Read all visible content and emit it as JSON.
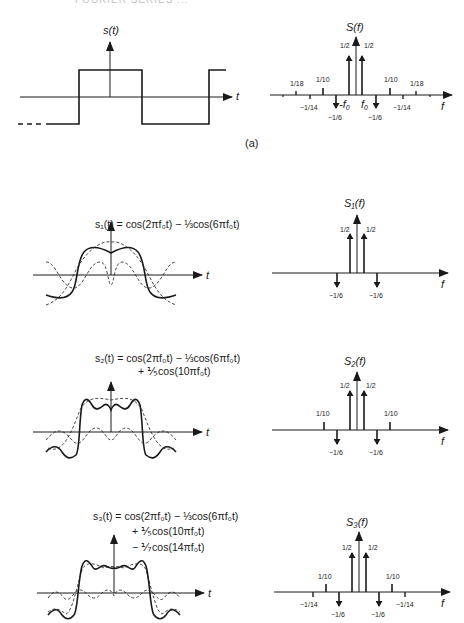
{
  "header": {
    "clipped_text": "FOURIER SERIES ..."
  },
  "panel_a": {
    "caption": "(a)",
    "time_plot": {
      "ylabel": "s(t)",
      "xlabel": "t",
      "description": "square wave"
    },
    "spectrum": {
      "ylabel": "S(f)",
      "xlabel": "f",
      "labels": {
        "f0_neg": "-f",
        "f0_pos": "f",
        "f0_sub": "0",
        "half": "1/2",
        "tenth": "1/10",
        "eighteenth": "1/18",
        "neg_sixth": "−1/6",
        "neg_fourteenth": "−1/14"
      }
    }
  },
  "panel_1": {
    "equation_line1": "s₁(t) = cos(2πf₀t) − ⅓cos(6πf₀t)",
    "time_xlabel": "t",
    "spectrum_ylabel": "S₁(f)",
    "spectrum_xlabel": "f"
  },
  "panel_2": {
    "equation_line1": "s₂(t) = cos(2πf₀t) − ⅓cos(6πf₀t)",
    "equation_line2": "+ ⅕cos(10πf₀t)",
    "time_xlabel": "t",
    "spectrum_ylabel": "S₂(f)",
    "spectrum_xlabel": "f"
  },
  "panel_3": {
    "equation_line1": "s₃(t) = cos(2πf₀t) − ⅓cos(6πf₀t)",
    "equation_line2": "+ ⅕cos(10πf₀t)",
    "equation_line3": "− ⅐cos(14πf₀t)",
    "time_xlabel": "t",
    "spectrum_ylabel": "S₃(f)",
    "spectrum_xlabel": "f"
  },
  "spectra": [
    {
      "name": "S(f)",
      "harmonics": [
        {
          "k": 1,
          "amp": 0.5
        },
        {
          "k": 3,
          "amp": -0.1667
        },
        {
          "k": 5,
          "amp": 0.1
        },
        {
          "k": 7,
          "amp": -0.0714
        },
        {
          "k": 9,
          "amp": 0.0556
        }
      ]
    },
    {
      "name": "S1(f)",
      "harmonics": [
        {
          "k": 1,
          "amp": 0.5
        },
        {
          "k": 3,
          "amp": -0.1667
        }
      ]
    },
    {
      "name": "S2(f)",
      "harmonics": [
        {
          "k": 1,
          "amp": 0.5
        },
        {
          "k": 3,
          "amp": -0.1667
        },
        {
          "k": 5,
          "amp": 0.1
        }
      ]
    },
    {
      "name": "S3(f)",
      "harmonics": [
        {
          "k": 1,
          "amp": 0.5
        },
        {
          "k": 3,
          "amp": -0.1667
        },
        {
          "k": 5,
          "amp": 0.1
        },
        {
          "k": 7,
          "amp": -0.0714
        }
      ]
    }
  ],
  "colors": {
    "ink": "#1a1a1a",
    "background": "#ffffff"
  }
}
